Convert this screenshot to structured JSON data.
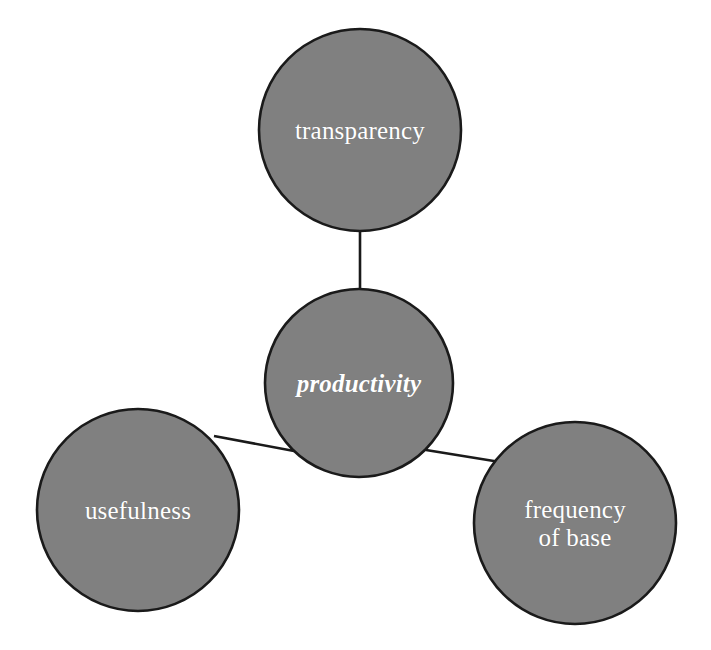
{
  "diagram": {
    "background_color": "#ffffff",
    "node_fill_color": "#808080",
    "node_border_color": "#1a1a1a",
    "node_text_color": "#ffffff",
    "edge_color": "#1a1a1a",
    "nodes": [
      {
        "id": "transparency",
        "label": "transparency",
        "cx": 360,
        "cy": 130,
        "r": 102,
        "emphasis": false,
        "font_size": 25
      },
      {
        "id": "productivity",
        "label": "productivity",
        "cx": 359,
        "cy": 383,
        "r": 95,
        "emphasis": true,
        "font_size": 25
      },
      {
        "id": "usefulness",
        "label": "usefulness",
        "cx": 138,
        "cy": 510,
        "r": 102,
        "emphasis": false,
        "font_size": 25
      },
      {
        "id": "frequency-of-base",
        "label": "frequency\nof base",
        "cx": 575,
        "cy": 523,
        "r": 102,
        "emphasis": false,
        "font_size": 25
      }
    ],
    "edges": [
      {
        "id": "edge-productivity-transparency",
        "from": "productivity",
        "to": "transparency",
        "x1": 360,
        "y1": 288,
        "x2": 360,
        "y2": 232
      },
      {
        "id": "edge-productivity-usefulness",
        "from": "productivity",
        "to": "usefulness",
        "x1": 294,
        "y1": 451,
        "x2": 214,
        "y2": 436
      },
      {
        "id": "edge-productivity-frequency",
        "from": "productivity",
        "to": "frequency-of-base",
        "x1": 426,
        "y1": 450,
        "x2": 500,
        "y2": 462
      }
    ]
  }
}
